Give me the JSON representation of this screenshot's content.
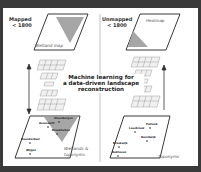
{
  "left_panel": {
    "title_line1": "Mapped",
    "title_line2": "< 1800",
    "top_map_label": "Wetland map",
    "bottom_map_label_line1": "Wetlands &",
    "bottom_map_label_line2": "toponyms",
    "toponyms": [
      "Steenbergen",
      "Assendelft",
      "Broekhuizen",
      "Hoenderdaal",
      "Wijgen"
    ]
  },
  "right_panel": {
    "title_line1": "Unmapped",
    "title_line2": "< 1800",
    "top_map_label": "Heatmap",
    "bottom_map_label": "Toponyms",
    "toponyms": [
      "Putland",
      "Leusbroek",
      "Noordwijk",
      "Broekwijk",
      "Bokhoven"
    ]
  },
  "center": {
    "line1": "Machine learning for",
    "line2": "a data-driven landscape",
    "line3": "reconstruction"
  },
  "colors": {
    "background": "#3a3a3a",
    "panel": "#ffffff",
    "triangle": "#a6a6a6",
    "outline": "#222222"
  }
}
